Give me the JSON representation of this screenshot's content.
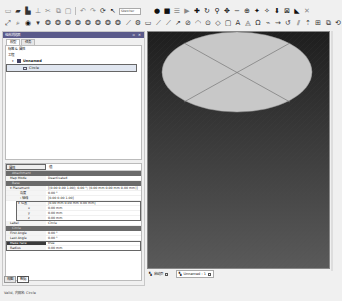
{
  "toolbar": {
    "row1_icons": [
      "new-file",
      "open-file",
      "save",
      "print",
      "cut",
      "copy",
      "paste",
      "undo",
      "redo",
      "refresh",
      "macro",
      "workbench-select",
      "record",
      "stop",
      "macro-edit",
      "play",
      "pointer",
      "draw-style",
      "std-view",
      "axo",
      "front",
      "top",
      "right",
      "rear",
      "bottom",
      "left",
      "measure",
      "whats-this"
    ],
    "workbench_label": "Sketcher",
    "row2_icons": [
      "fit-all",
      "fit-selection",
      "view-iso",
      "view-front",
      "view-top",
      "view-right",
      "view-rear",
      "view-bottom",
      "view-left",
      "box-zoom",
      "sketch",
      "line",
      "arc",
      "circle",
      "conic",
      "rectangle",
      "polyline",
      "bspline",
      "point",
      "fillet",
      "trim",
      "extend",
      "split",
      "constraint-coincident",
      "constraint-horizontal",
      "construction",
      "mirror",
      "array"
    ]
  },
  "combo_view": {
    "title": "组合浏览器",
    "title_controls": "▫ ✕",
    "tabs": [
      {
        "label": "模型",
        "active": true
      },
      {
        "label": "任务",
        "active": false
      }
    ],
    "label_row": "标签 & 属性",
    "section": "工程",
    "tree": [
      {
        "label": "Unnamed",
        "level": 0,
        "expanded": true,
        "selected": false
      },
      {
        "label": "Circle",
        "level": 1,
        "expanded": false,
        "selected": true
      }
    ]
  },
  "property_editor": {
    "header_col1": "属性",
    "header_col2": "值",
    "groups": [
      {
        "name": "Attachment",
        "rows": [
          {
            "key": "Map Mode",
            "value": "Deactivated"
          }
        ]
      },
      {
        "name": "Base",
        "rows": [
          {
            "key": "Placement",
            "value": "[(0.00 0.00 1.00); 0.00 °; (0.00 mm  0.00 mm  0.00 mm)]",
            "expandable": true
          },
          {
            "key": "角度",
            "value": "0.00 °",
            "indent": 1
          },
          {
            "key": "轴线",
            "value": "[0.00 0.00 1.00]",
            "indent": 1,
            "expandable": true
          },
          {
            "key": "位置",
            "value": "[0.00 mm  0.00 mm  0.00 mm]",
            "indent": 1,
            "expandable": true,
            "boxed": true
          },
          {
            "key": "x",
            "value": "0.00 mm",
            "indent": 2,
            "boxed": true
          },
          {
            "key": "y",
            "value": "0.00 mm",
            "indent": 2,
            "boxed": true
          },
          {
            "key": "z",
            "value": "0.00 mm",
            "indent": 2,
            "boxed": true
          },
          {
            "key": "Label",
            "value": "Circle"
          }
        ]
      },
      {
        "name": "Circle",
        "rows": [
          {
            "key": "First Angle",
            "value": "0.00 °"
          },
          {
            "key": "Last Angle",
            "value": "0.00 °"
          },
          {
            "key": "Make Face",
            "value": "true",
            "selected": true,
            "boxed": true
          },
          {
            "key": "Radius",
            "value": "0.00 mm",
            "boxed": true
          }
        ]
      }
    ]
  },
  "bottom_tabs": [
    {
      "label": "视图",
      "active": false
    },
    {
      "label": "数据",
      "active": true
    }
  ],
  "view3d": {
    "bg_top": "#1e1e1e",
    "bg_bottom": "#5a5a5a",
    "shape": "circle-face",
    "face_color": "#c8c8c8",
    "tabs": [
      {
        "label": "启动页",
        "active": false
      },
      {
        "label": "Unnamed : 1",
        "active": true
      }
    ]
  },
  "statusbar": {
    "text": "Valid, 内部名: Circle"
  }
}
